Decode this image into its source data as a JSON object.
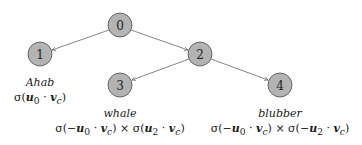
{
  "tree": {
    "nodes": [
      {
        "id": "0",
        "x": 120,
        "y": 25
      },
      {
        "id": "1",
        "x": 40,
        "y": 54
      },
      {
        "id": "2",
        "x": 200,
        "y": 54
      },
      {
        "id": "3",
        "x": 120,
        "y": 85
      },
      {
        "id": "4",
        "x": 280,
        "y": 85
      }
    ],
    "edges": [
      {
        "from": "0",
        "to": "1"
      },
      {
        "from": "0",
        "to": "2"
      },
      {
        "from": "2",
        "to": "3"
      },
      {
        "from": "2",
        "to": "4"
      }
    ],
    "node_fill": "#b3b3b3",
    "node_stroke": "#4d4d4d"
  },
  "leaves": {
    "ahab": {
      "word": "Ahab",
      "formula": "σ(u₀ · v꜀)"
    },
    "whale": {
      "word": "whale",
      "formula": "σ(−u₀ · v꜀) × σ(u₂ · v꜀)"
    },
    "blubber": {
      "word": "blubber",
      "formula": "σ(−u₀ · v꜀) × σ(−u₂ · v꜀)"
    }
  }
}
